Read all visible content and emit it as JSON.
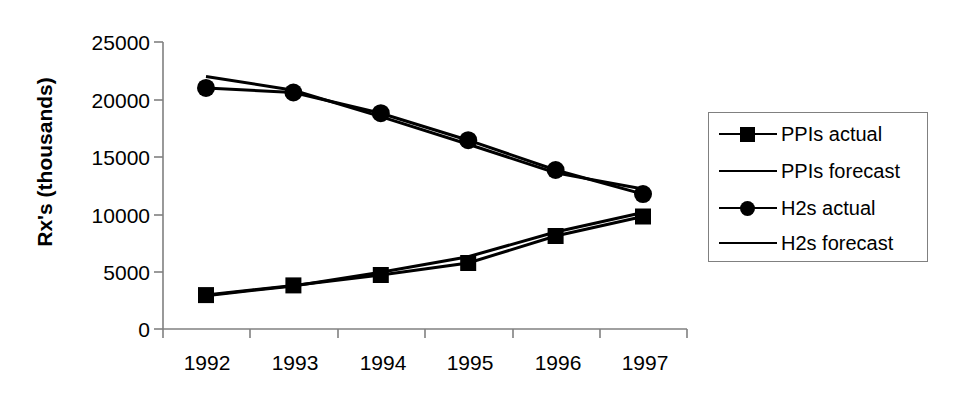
{
  "chart_data": {
    "type": "line",
    "title": "",
    "xlabel": "",
    "ylabel": "Rx's (thousands)",
    "categories": [
      "1992",
      "1993",
      "1994",
      "1995",
      "1996",
      "1997"
    ],
    "ylim": [
      0,
      25000
    ],
    "yticks": [
      0,
      5000,
      10000,
      15000,
      20000,
      25000
    ],
    "ytick_labels": [
      "0",
      "5000",
      "10000",
      "15000",
      "20000",
      "25000"
    ],
    "grid": false,
    "legend_position": "right",
    "series": [
      {
        "name": "PPIs actual",
        "marker": "square",
        "line": "solid",
        "values": [
          2950,
          3800,
          4700,
          5750,
          8100,
          9800
        ]
      },
      {
        "name": "PPIs forecast",
        "marker": "none",
        "line": "solid",
        "values": [
          2900,
          3750,
          4950,
          6300,
          8450,
          10150
        ]
      },
      {
        "name": "H2s actual",
        "marker": "circle",
        "line": "solid",
        "values": [
          21000,
          20600,
          18800,
          16450,
          13850,
          11750
        ]
      },
      {
        "name": "H2s forecast",
        "marker": "none",
        "line": "solid",
        "values": [
          22000,
          20800,
          18500,
          16100,
          13600,
          12200
        ]
      }
    ]
  },
  "axes": {
    "y_label": "Rx's (thousands)",
    "y_ticks": [
      "25000",
      "20000",
      "15000",
      "10000",
      "5000",
      "0"
    ],
    "x_ticks": [
      "1992",
      "1993",
      "1994",
      "1995",
      "1996",
      "1997"
    ]
  },
  "legend": {
    "items": [
      {
        "label": "PPIs actual",
        "marker": "square"
      },
      {
        "label": "PPIs forecast",
        "marker": "none"
      },
      {
        "label": "H2s actual",
        "marker": "circle"
      },
      {
        "label": "H2s forecast",
        "marker": "none"
      }
    ]
  },
  "colors": {
    "series": "#000000",
    "axis": "#808080",
    "legend_border": "#808080",
    "background": "#ffffff"
  }
}
